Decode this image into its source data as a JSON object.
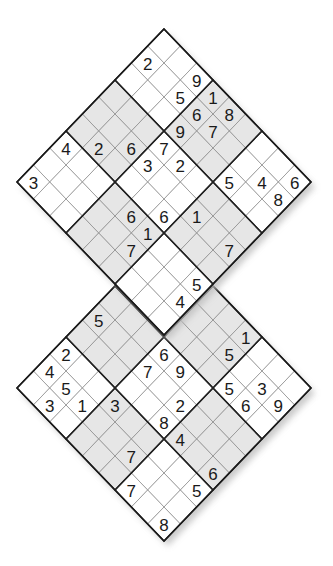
{
  "puzzle": {
    "type": "double-diamond-sudoku",
    "size": 9,
    "geometry": {
      "center_x": 164,
      "half_width": 16.33,
      "half_height": 17,
      "top_grid_apex_y": 29,
      "bottom_grid_apex_y": 235
    },
    "colors": {
      "shaded": "#e6e6e6",
      "white": "#ffffff",
      "line": "#8a8a8a",
      "border": "#1a1a1a",
      "digit": "#1a1a1a",
      "shadow": "#bdbdbd"
    },
    "shared_box": "Bottom 3x3 box of top grid = top 3x3 box of bottom grid",
    "grids": [
      {
        "name": "top-grid",
        "rows": [
          "..918...6",
          "2.567..48",
          "...9..5..",
          "...72....",
          "..63..1.7",
          ".2...6...",
          "4...61..5",
          ".....7..4",
          "3........"
        ]
      },
      {
        "name": "bottom-grid",
        "rows": [
          "..5..1...",
          "..4..5.39",
          "......56.",
          "...69....",
          "5..7.2...",
          ".....84.6",
          "2..3....5",
          "451..7...",
          ".3....7.8"
        ]
      }
    ]
  }
}
